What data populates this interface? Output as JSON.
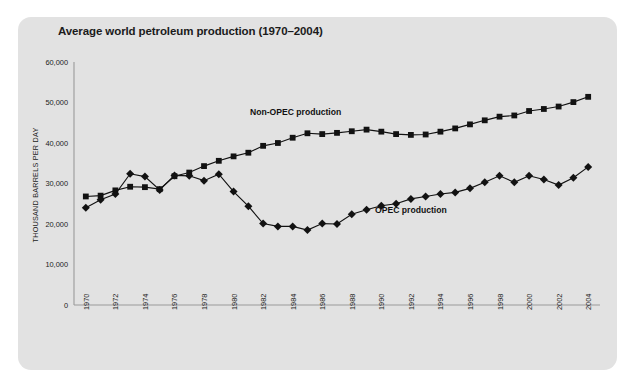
{
  "figure": {
    "panel_bg": "#e2e2e2",
    "page_bg": "#ffffff",
    "title": "Average world petroleum production (1970–2004)",
    "ylabel": "THOUSAND BARRELS PER DAY",
    "origin_label": "0"
  },
  "chart_data": {
    "type": "line",
    "title": "Average world petroleum production (1970–2004)",
    "xlabel": "",
    "ylabel": "THOUSAND BARRELS PER DAY",
    "xlim": [
      1969.2,
      2004.8
    ],
    "ylim": [
      0,
      60000
    ],
    "yticks": [
      10000,
      20000,
      30000,
      40000,
      50000,
      60000
    ],
    "ytick_labels": [
      "10,000",
      "20,000",
      "30,000",
      "40,000",
      "50,000",
      "60,000"
    ],
    "xticks": [
      1970,
      1972,
      1974,
      1976,
      1978,
      1980,
      1982,
      1984,
      1986,
      1988,
      1990,
      1992,
      1994,
      1996,
      1998,
      2000,
      2002,
      2004
    ],
    "xtick_labels": [
      "1970",
      "1972",
      "1974",
      "1976",
      "1978",
      "1980",
      "1982",
      "1984",
      "1986",
      "1988",
      "1990",
      "1992",
      "1994",
      "1996",
      "1998",
      "2000",
      "2002",
      "2004"
    ],
    "xtick_rotation": -90,
    "grid": false,
    "legend_position": "inline-annotation",
    "x": [
      1970,
      1971,
      1972,
      1973,
      1974,
      1975,
      1976,
      1977,
      1978,
      1979,
      1980,
      1981,
      1982,
      1983,
      1984,
      1985,
      1986,
      1987,
      1988,
      1989,
      1990,
      1991,
      1992,
      1993,
      1994,
      1995,
      1996,
      1997,
      1998,
      1999,
      2000,
      2001,
      2002,
      2003,
      2004
    ],
    "series": [
      {
        "name": "Non-OPEC production",
        "marker": "square",
        "color": "#121212",
        "label_x": 1984.2,
        "label_y": 47000,
        "values": [
          26800,
          27000,
          28300,
          29200,
          29100,
          28600,
          31800,
          32700,
          34300,
          35600,
          36700,
          37600,
          39300,
          40000,
          41300,
          42400,
          42200,
          42500,
          42900,
          43300,
          42800,
          42200,
          42000,
          42100,
          42800,
          43600,
          44600,
          45600,
          46500,
          46800,
          47900,
          48400,
          49000,
          50100,
          51400
        ]
      },
      {
        "name": "OPEC production",
        "marker": "diamond",
        "color": "#121212",
        "label_x": 1992.0,
        "label_y": 22800,
        "values": [
          24000,
          26000,
          27400,
          32400,
          31700,
          28400,
          32000,
          31900,
          30700,
          32300,
          28000,
          24400,
          20100,
          19400,
          19400,
          18500,
          20100,
          20000,
          22400,
          23500,
          24500,
          25000,
          26200,
          26800,
          27400,
          27800,
          28800,
          30300,
          31900,
          30300,
          31900,
          31000,
          29600,
          31400,
          34100
        ]
      }
    ]
  }
}
